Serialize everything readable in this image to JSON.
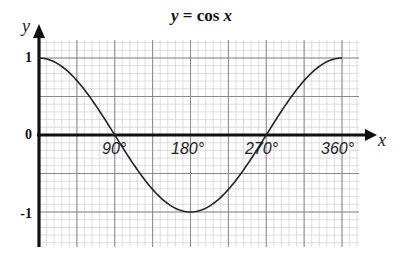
{
  "title": {
    "y_var": "y",
    "equals": " = cos ",
    "x_var": "x"
  },
  "axes": {
    "x_label": "x",
    "y_label": "y",
    "x_ticks": [
      "90°",
      "180°",
      "270°",
      "360°"
    ],
    "y_ticks": [
      "1",
      "0",
      "-1"
    ]
  },
  "colors": {
    "grid_minor": "#cfcfcf",
    "grid_major": "#8a8a8a",
    "axis": "#111111",
    "curve": "#222222"
  },
  "chart_data": {
    "type": "line",
    "title": "y = cos x",
    "xlabel": "x",
    "ylabel": "y",
    "x_unit": "degrees",
    "xlim": [
      0,
      360
    ],
    "ylim": [
      -1.4,
      1.3
    ],
    "grid": true,
    "x_tick_labels": [
      "90°",
      "180°",
      "270°",
      "360°"
    ],
    "y_tick_labels": [
      "1",
      "0",
      "-1"
    ],
    "series": [
      {
        "name": "y = cos x",
        "x": [
          0,
          30,
          60,
          90,
          120,
          150,
          180,
          210,
          240,
          270,
          300,
          330,
          360
        ],
        "y": [
          1,
          0.866,
          0.5,
          0,
          -0.5,
          -0.866,
          -1,
          -0.866,
          -0.5,
          0,
          0.5,
          0.866,
          1
        ]
      }
    ]
  }
}
